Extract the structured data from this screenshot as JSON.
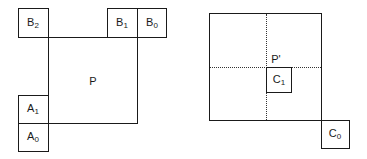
{
  "left_diagram": {
    "main_block": {
      "label": "P"
    },
    "blocks": [
      {
        "id": "B2",
        "base": "B",
        "sub": "2"
      },
      {
        "id": "B1",
        "base": "B",
        "sub": "1"
      },
      {
        "id": "B0",
        "base": "B",
        "sub": "0"
      },
      {
        "id": "A1",
        "base": "A",
        "sub": "1"
      },
      {
        "id": "A0",
        "base": "A",
        "sub": "0"
      }
    ]
  },
  "right_diagram": {
    "point_label": "P'",
    "blocks": [
      {
        "id": "C1",
        "base": "C",
        "sub": "1"
      },
      {
        "id": "C0",
        "base": "C",
        "sub": "0"
      }
    ]
  }
}
